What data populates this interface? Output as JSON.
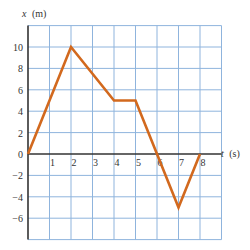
{
  "chart_data": {
    "type": "line",
    "title": "",
    "xlabel": "t (s)",
    "ylabel": "x (m)",
    "x_axis_label_italic_var": "t",
    "x_axis_label_unit": "(s)",
    "y_axis_label_italic_var": "x",
    "y_axis_label_unit": "(m)",
    "xlim": [
      0,
      9
    ],
    "ylim": [
      -8,
      12
    ],
    "x_ticks": [
      1,
      2,
      3,
      4,
      5,
      6,
      7,
      8
    ],
    "y_ticks": [
      10,
      8,
      6,
      4,
      2,
      0,
      -2,
      -4,
      -6
    ],
    "x_tick_labels": [
      "1",
      "2",
      "3",
      "4",
      "5",
      "6",
      "7",
      "8"
    ],
    "y_tick_labels": [
      "10",
      "8",
      "6",
      "4",
      "2",
      "0",
      "−2",
      "−4",
      "−6"
    ],
    "grid": true,
    "grid_x_step": 1,
    "grid_y_step": 2,
    "legend": null,
    "series": [
      {
        "name": "position",
        "x": [
          0,
          2,
          4,
          5,
          6,
          7,
          8
        ],
        "y": [
          0,
          10,
          5,
          5,
          0,
          -5,
          0
        ]
      }
    ]
  },
  "colors": {
    "line": "#d2691e",
    "grid": "#8fb4dd",
    "axis": "#333333",
    "background": "#ffffff"
  }
}
